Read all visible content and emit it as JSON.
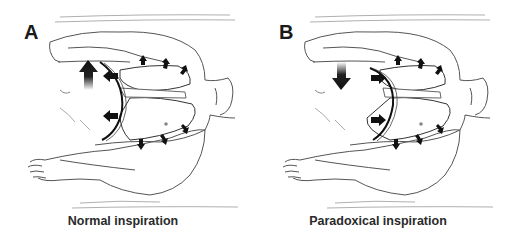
{
  "figure": {
    "panels": [
      {
        "id": "A",
        "letter": "A",
        "caption": "Normal inspiration",
        "abdomen_arrow": "up",
        "diaphragm_arrows": "outward-left",
        "chest_wall_arrows": "outward"
      },
      {
        "id": "B",
        "letter": "B",
        "caption": "Paradoxical inspiration",
        "abdomen_arrow": "down",
        "diaphragm_arrows": "inward-right",
        "chest_wall_arrows": "outward"
      }
    ]
  },
  "colors": {
    "ink": "#1a1a1a",
    "line": "#555555",
    "light_line": "#9a9a9a",
    "background": "#ffffff"
  }
}
